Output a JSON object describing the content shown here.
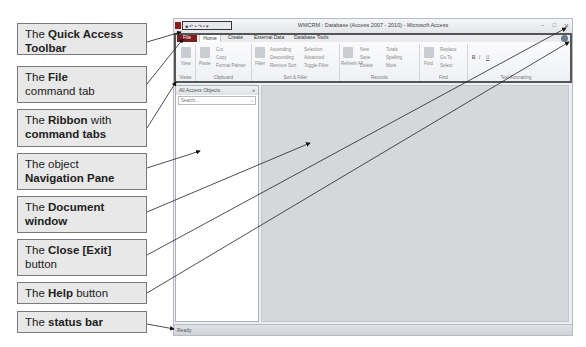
{
  "callouts": [
    {
      "id": "qat",
      "pre": "The ",
      "bold": "Quick Access Toolbar",
      "post": ""
    },
    {
      "id": "file",
      "pre": "The ",
      "bold": "File",
      "post": " command tab"
    },
    {
      "id": "ribbon",
      "pre": "The ",
      "bold": "Ribbon",
      "post": " with ",
      "bold2": "command tabs"
    },
    {
      "id": "nav",
      "pre": "The object ",
      "bold": "Navigation Pane",
      "post": ""
    },
    {
      "id": "doc",
      "pre": "The ",
      "bold": "Document window",
      "post": ""
    },
    {
      "id": "close",
      "pre": "The ",
      "bold": "Close [Exit]",
      "post": " button"
    },
    {
      "id": "help",
      "pre": "The ",
      "bold": "Help",
      "post": " button"
    },
    {
      "id": "status",
      "pre": "The ",
      "bold": "status bar",
      "post": ""
    }
  ],
  "window": {
    "title": "WMCRM : Database (Access 2007 - 2010) - Microsoft Access",
    "qat_label": "■ ↶ • ↷ • ▾",
    "win_buttons": [
      "–",
      "□",
      "✕"
    ],
    "tabs": [
      "File",
      "Home",
      "Create",
      "External Data",
      "Database Tools"
    ],
    "ribbon_groups": [
      {
        "label": "Views",
        "items": [
          "View"
        ]
      },
      {
        "label": "Clipboard",
        "items": [
          "Paste",
          "Cut",
          "Copy",
          "Format Painter"
        ]
      },
      {
        "label": "Sort & Filter",
        "items": [
          "Filter",
          "Ascending",
          "Descending",
          "Remove Sort",
          "Selection",
          "Advanced",
          "Toggle Filter"
        ]
      },
      {
        "label": "Records",
        "items": [
          "Refresh All",
          "New",
          "Save",
          "Delete",
          "Totals",
          "Spelling",
          "More"
        ]
      },
      {
        "label": "Find",
        "items": [
          "Find",
          "Replace",
          "Go To",
          "Select"
        ]
      },
      {
        "label": "Text Formatting",
        "items": [
          "B",
          "I",
          "U"
        ]
      }
    ],
    "nav_pane": {
      "header": "All Access Objects",
      "search_placeholder": "Search..."
    },
    "status_text": "Ready"
  }
}
